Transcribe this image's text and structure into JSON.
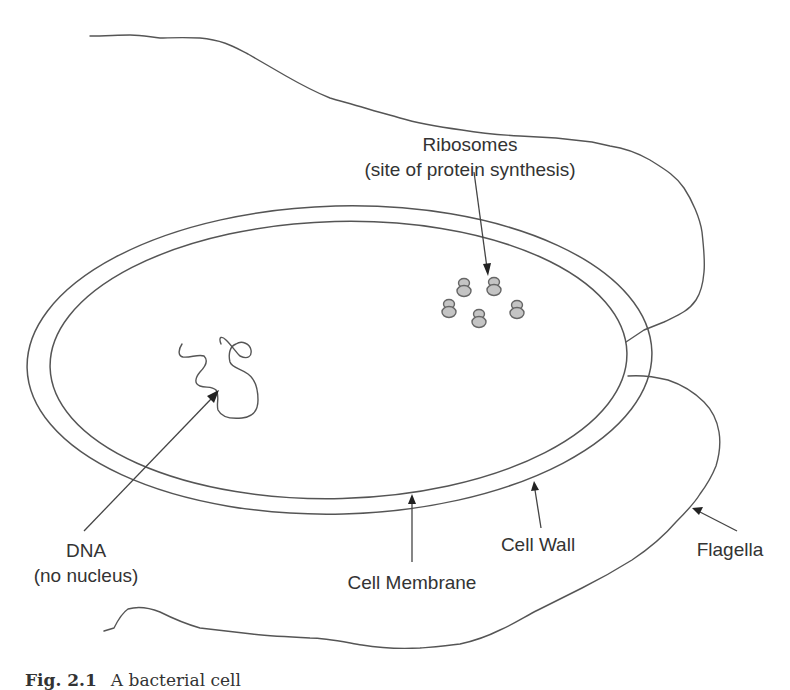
{
  "diagram": {
    "caption": {
      "figure_number": "Fig. 2.1",
      "text": "A bacterial cell"
    },
    "labels": {
      "ribosomes": {
        "line1": "Ribosomes",
        "line2": "(site of protein synthesis)"
      },
      "dna": {
        "line1": "DNA",
        "line2": "(no nucleus)"
      },
      "cell_membrane": "Cell Membrane",
      "cell_wall": "Cell Wall",
      "flagella": "Flagella"
    },
    "components": [
      {
        "name": "Cell Wall",
        "shape": "outer ellipse"
      },
      {
        "name": "Cell Membrane",
        "shape": "inner ellipse"
      },
      {
        "name": "DNA",
        "shape": "squiggly loop, no nucleus"
      },
      {
        "name": "Ribosomes",
        "count": 5,
        "shape": "small stacked double circles"
      },
      {
        "name": "Flagella",
        "count": 2,
        "shape": "long wavy tails"
      }
    ],
    "colors": {
      "line": "#555555",
      "ribosome_fill": "#c4c4c4",
      "text": "#333333",
      "background": "#ffffff"
    }
  }
}
